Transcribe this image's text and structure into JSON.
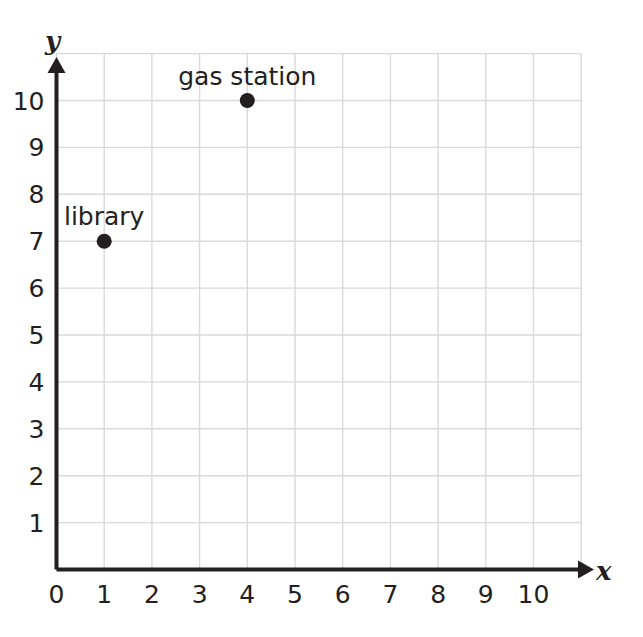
{
  "chart_data": {
    "type": "scatter",
    "title": "",
    "xlabel": "x",
    "ylabel": "y",
    "xlim": [
      0,
      11
    ],
    "ylim": [
      0,
      11
    ],
    "xticks": [
      0,
      1,
      2,
      3,
      4,
      5,
      6,
      7,
      8,
      9,
      10
    ],
    "yticks": [
      0,
      1,
      2,
      3,
      4,
      5,
      6,
      7,
      8,
      9,
      10
    ],
    "xtick_labels": [
      "0",
      "1",
      "2",
      "3",
      "4",
      "5",
      "6",
      "7",
      "8",
      "9",
      "10"
    ],
    "ytick_labels": [
      "0",
      "1",
      "2",
      "3",
      "4",
      "5",
      "6",
      "7",
      "8",
      "9",
      "10"
    ],
    "grid": true,
    "legend": "none",
    "points": [
      {
        "label": "library",
        "x": 1,
        "y": 7
      },
      {
        "label": "gas station",
        "x": 4,
        "y": 10
      }
    ],
    "colors": {
      "grid": "#d9d9d9",
      "axis": "#231f20",
      "point": "#231f20",
      "text": "#231f20",
      "background": "#ffffff"
    }
  },
  "axes": {
    "x_axis_label": "x",
    "y_axis_label": "y"
  }
}
